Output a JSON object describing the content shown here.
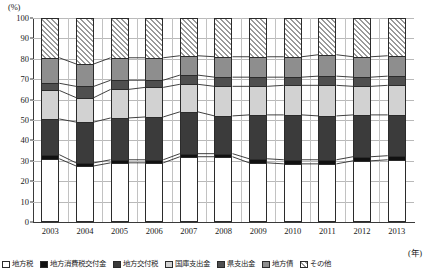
{
  "chart_data": {
    "type": "bar",
    "subtype": "100% stacked bar with connecting ribbons",
    "title": "",
    "xlabel": "(年)",
    "ylabel": "(%)",
    "ylim": [
      0,
      100
    ],
    "ytick_step": 10,
    "yticks": [
      0,
      10,
      20,
      30,
      40,
      50,
      60,
      70,
      80,
      90,
      100
    ],
    "grid": true,
    "legend_position": "bottom",
    "categories": [
      "2003",
      "2004",
      "2005",
      "2006",
      "2007",
      "2008",
      "2009",
      "2010",
      "2011",
      "2012",
      "2013"
    ],
    "series": [
      {
        "name": "地方税",
        "key": "local-tax",
        "color": "#ffffff",
        "values": [
          31.0,
          27.5,
          29.0,
          29.0,
          32.0,
          32.0,
          29.0,
          28.5,
          28.5,
          30.0,
          30.5
        ]
      },
      {
        "name": "地方消費税交付金",
        "key": "consumption",
        "color": "#111111",
        "values": [
          2.0,
          1.5,
          1.5,
          1.5,
          1.5,
          1.5,
          2.0,
          2.0,
          2.0,
          2.0,
          2.0
        ]
      },
      {
        "name": "地方交付税",
        "key": "grant-tax",
        "color": "#3b3b3b",
        "values": [
          17.5,
          20.0,
          20.5,
          21.0,
          20.5,
          18.5,
          21.5,
          22.0,
          21.5,
          20.5,
          20.0
        ]
      },
      {
        "name": "国庫支出金",
        "key": "national",
        "color": "#d2d2d2",
        "values": [
          14.0,
          12.0,
          14.0,
          14.5,
          13.5,
          14.5,
          14.0,
          14.5,
          15.0,
          14.0,
          14.5
        ]
      },
      {
        "name": "県支出金",
        "key": "pref",
        "color": "#4f4f4f",
        "values": [
          3.5,
          5.5,
          4.5,
          3.5,
          4.5,
          4.5,
          4.5,
          4.0,
          4.5,
          4.5,
          4.5
        ]
      },
      {
        "name": "地方債",
        "key": "bonds",
        "color": "#8e8e8e",
        "values": [
          12.5,
          11.0,
          11.0,
          11.0,
          9.5,
          10.0,
          10.0,
          10.0,
          10.5,
          10.0,
          10.0
        ]
      },
      {
        "name": "その他",
        "key": "other",
        "color": "hatch",
        "values": [
          19.5,
          22.5,
          19.5,
          19.5,
          18.5,
          19.0,
          19.0,
          19.0,
          18.0,
          19.0,
          18.5
        ]
      }
    ]
  },
  "axes": {
    "y_unit": "(%)",
    "x_unit": "(年)"
  },
  "legend": {
    "items": [
      {
        "label": "地方税",
        "key": "local-tax"
      },
      {
        "label": "地方消費税交付金",
        "key": "consumption"
      },
      {
        "label": "地方交付税",
        "key": "grant-tax"
      },
      {
        "label": "国庫支出金",
        "key": "national"
      },
      {
        "label": "県支出金",
        "key": "pref"
      },
      {
        "label": "地方債",
        "key": "bonds"
      },
      {
        "label": "その他",
        "key": "other"
      }
    ]
  }
}
